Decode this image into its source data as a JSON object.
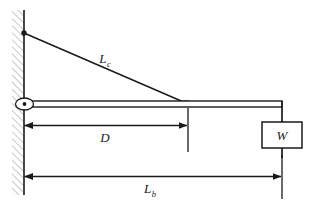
{
  "diagram": {
    "type": "engineering-free-body-diagram",
    "canvas": {
      "width": 318,
      "height": 214
    },
    "background_color": "#ffffff",
    "line_color": "#1a1a1a",
    "hatch_color": "#9a9a9a"
  },
  "labels": {
    "cable": {
      "base": "L",
      "subscript": "c",
      "full": "Lc"
    },
    "distance_to_cable": {
      "base": "D",
      "subscript": "",
      "full": "D"
    },
    "beam_length": {
      "base": "L",
      "subscript": "b",
      "full": "Lb"
    },
    "weight": {
      "base": "W",
      "subscript": "",
      "full": "W"
    }
  },
  "elements": {
    "wall": {
      "name": "hatched-wall",
      "x": 12,
      "y": 10,
      "width": 12,
      "height": 185
    },
    "wall_face_line": {
      "x": 24,
      "y_top": 10,
      "y_bottom": 195
    },
    "pin_joint": {
      "cx": 24,
      "cy": 104,
      "rx": 9,
      "ry": 6,
      "dot_r": 1.8
    },
    "cable_anchor": {
      "cx": 24,
      "cy": 33,
      "r": 2.6
    },
    "cable": {
      "x1": 24,
      "y1": 33,
      "x2": 188,
      "y2": 104
    },
    "cable_beam_joint": {
      "x": 185,
      "y": 101,
      "size": 6
    },
    "beam": {
      "x": 24,
      "y": 101,
      "width": 258,
      "height": 6
    },
    "hanger_line": {
      "x": 282,
      "y_top": 101,
      "y_bottom": 122
    },
    "weight_box": {
      "x": 262,
      "y": 122,
      "width": 40,
      "height": 26
    },
    "weight_tail_line": {
      "x": 282,
      "y_top": 148,
      "y_bottom": 160
    },
    "dim_D": {
      "x1": 24,
      "x2": 188,
      "y": 125,
      "ext_x": 188,
      "ext_y_top": 108,
      "ext_y_bottom": 152
    },
    "dim_Lb": {
      "x1": 24,
      "x2": 282,
      "y": 176,
      "ext_x": 282,
      "ext_y_top": 155,
      "ext_y_bottom": 199
    }
  },
  "annotations": {
    "cable_label_pos": {
      "x": 108,
      "y": 62
    },
    "distance_label_pos": {
      "x": 104,
      "y": 140
    },
    "beam_length_label_pos": {
      "x": 149,
      "y": 191
    },
    "weight_label_pos": {
      "x": 282,
      "y": 140
    }
  }
}
